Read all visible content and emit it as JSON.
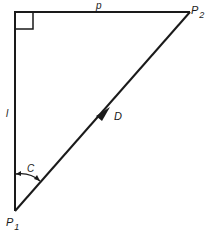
{
  "diagram": {
    "type": "right-triangle",
    "labels": {
      "top_side": "p",
      "left_side": "l",
      "hypotenuse": "D",
      "angle": "C",
      "point_top_right": "P",
      "point_top_right_sub": "2",
      "point_bottom": "P",
      "point_bottom_sub": "1"
    },
    "colors": {
      "stroke": "#1a1a1a",
      "background": "#ffffff"
    }
  }
}
